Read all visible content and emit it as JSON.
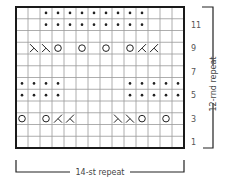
{
  "chart": {
    "columns": 14,
    "rows": 12,
    "stitch_repeat_label": "14-st repeat",
    "round_repeat_label": "12-rnd repeat",
    "row_labels": [
      "1",
      "3",
      "5",
      "7",
      "9",
      "11"
    ],
    "legend_symbols": {
      "empty": "knit",
      "dot": "purl",
      "o": "yarn over",
      "ssk": "ssk (left-leaning decrease)",
      "k2tog": "k2tog (right-leaning decrease)"
    },
    "grid_rows_bottom_to_top": [
      [
        "",
        "",
        "",
        "",
        "",
        "",
        "",
        "",
        "",
        "",
        "",
        "",
        "",
        ""
      ],
      [
        "",
        "",
        "",
        "",
        "",
        "",
        "",
        "",
        "",
        "",
        "",
        "",
        "",
        ""
      ],
      [
        "o",
        "",
        "o",
        "k2tog",
        "k2tog",
        "",
        "",
        "",
        "ssk",
        "ssk",
        "o",
        "",
        "o",
        ""
      ],
      [
        "",
        "",
        "",
        "",
        "",
        "",
        "",
        "",
        "",
        "",
        "",
        "",
        "",
        ""
      ],
      [
        "dot",
        "dot",
        "dot",
        "dot",
        "",
        "",
        "",
        "",
        "",
        "dot",
        "dot",
        "dot",
        "dot",
        "dot"
      ],
      [
        "dot",
        "dot",
        "dot",
        "dot",
        "",
        "",
        "",
        "",
        "",
        "dot",
        "dot",
        "dot",
        "dot",
        "dot"
      ],
      [
        "",
        "",
        "",
        "",
        "",
        "",
        "",
        "",
        "",
        "",
        "",
        "",
        "",
        ""
      ],
      [
        "",
        "",
        "",
        "",
        "",
        "",
        "",
        "",
        "",
        "",
        "",
        "",
        "",
        ""
      ],
      [
        "",
        "ssk",
        "ssk",
        "o",
        "",
        "o",
        "",
        "o",
        "",
        "o",
        "k2tog",
        "k2tog",
        "",
        ""
      ],
      [
        "",
        "",
        "",
        "",
        "",
        "",
        "",
        "",
        "",
        "",
        "",
        "",
        "",
        ""
      ],
      [
        "",
        "",
        "dot",
        "dot",
        "dot",
        "dot",
        "dot",
        "dot",
        "dot",
        "dot",
        "dot",
        "",
        "",
        ""
      ],
      [
        "",
        "",
        "dot",
        "dot",
        "dot",
        "dot",
        "dot",
        "dot",
        "dot",
        "dot",
        "dot",
        "",
        "",
        ""
      ]
    ]
  },
  "colors": {
    "border": "#1a1a1a",
    "grid": "#999999",
    "symbol": "#222222",
    "label": "#555555"
  }
}
